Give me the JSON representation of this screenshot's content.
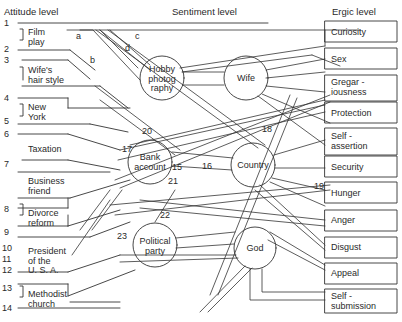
{
  "headers": {
    "attitude": "Attitude level",
    "sentiment": "Sentiment level",
    "ergic": "Ergic level"
  },
  "attitudes": [
    {
      "id": "film-play",
      "label": "Film\nplay",
      "numbers": [
        "1",
        "2"
      ]
    },
    {
      "id": "wifes-hair-style",
      "label": "Wife's\nhair style",
      "numbers": [
        "3"
      ]
    },
    {
      "id": "new-york",
      "label": "New\nYork",
      "numbers": [
        "4",
        "5"
      ]
    },
    {
      "id": "taxation",
      "label": "Taxation",
      "numbers": [
        "6"
      ]
    },
    {
      "id": "business-friend",
      "label": "Business\nfriend",
      "numbers": [
        "7"
      ]
    },
    {
      "id": "divorce-reform",
      "label": "Divorce\nreform",
      "numbers": [
        "8",
        "9"
      ]
    },
    {
      "id": "president-usa",
      "label": "President\nof the\nU. S. A.",
      "numbers": [
        "10",
        "11",
        "12"
      ]
    },
    {
      "id": "methodist-church",
      "label": "Methodist\nchurch",
      "numbers": [
        "13",
        "14"
      ]
    }
  ],
  "line_numbers": [
    "1",
    "2",
    "3",
    "4",
    "5",
    "6",
    "7",
    "8",
    "9",
    "10",
    "11",
    "12",
    "13",
    "14"
  ],
  "sentiments": [
    {
      "id": "hobby-photography",
      "label": "Hobby\nphotog\nraphy"
    },
    {
      "id": "wife",
      "label": "Wife"
    },
    {
      "id": "bank-account",
      "label": "Bank\naccount"
    },
    {
      "id": "country",
      "label": "Country"
    },
    {
      "id": "political-party",
      "label": "Political\nparty"
    },
    {
      "id": "god",
      "label": "God"
    }
  ],
  "ergs": [
    {
      "id": "curiosity",
      "label": "Curiosity"
    },
    {
      "id": "sex",
      "label": "Sex"
    },
    {
      "id": "gregariousness",
      "label": "Gregar -\niousness"
    },
    {
      "id": "protection",
      "label": "Protection"
    },
    {
      "id": "self-assertion",
      "label": "Self -\nassertion"
    },
    {
      "id": "security",
      "label": "Security"
    },
    {
      "id": "hunger",
      "label": "Hunger"
    },
    {
      "id": "anger",
      "label": "Anger"
    },
    {
      "id": "disgust",
      "label": "Disgust"
    },
    {
      "id": "appeal",
      "label": "Appeal"
    },
    {
      "id": "self-submission",
      "label": "Self -\nsubmission"
    }
  ],
  "path_labels": {
    "a": "a",
    "b": "b",
    "c": "c",
    "d": "d",
    "n15": "15",
    "n16": "16",
    "n17": "17",
    "n18": "18",
    "n19": "19",
    "n20": "20",
    "n21": "21",
    "n22": "22",
    "n23": "23"
  }
}
